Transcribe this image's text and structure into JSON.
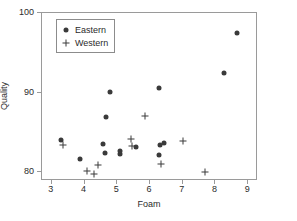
{
  "chart_data": {
    "type": "scatter",
    "title": "",
    "xlabel": "Foam",
    "ylabel": "Quality",
    "xlim": [
      2.7,
      9.3
    ],
    "ylim": [
      78.9,
      100.0
    ],
    "xticks": [
      3,
      4,
      5,
      6,
      7,
      8,
      9
    ],
    "yticks": [
      80,
      90,
      100
    ],
    "xticklabels": [
      "3",
      "4",
      "5",
      "6",
      "7",
      "8",
      "9"
    ],
    "yticklabels": [
      "80",
      "90",
      "100"
    ],
    "grid": false,
    "legend_position": "upper-left-inside",
    "series": [
      {
        "name": "Eastern",
        "marker": "filled-circle",
        "color": "#3a3a3a",
        "points": [
          [
            3.3,
            83.9
          ],
          [
            3.9,
            81.5
          ],
          [
            4.6,
            83.4
          ],
          [
            4.65,
            82.3
          ],
          [
            4.7,
            86.8
          ],
          [
            4.8,
            89.9
          ],
          [
            5.1,
            82.2
          ],
          [
            5.12,
            82.5
          ],
          [
            5.6,
            83.1
          ],
          [
            6.3,
            90.5
          ],
          [
            6.3,
            82.1
          ],
          [
            6.35,
            83.3
          ],
          [
            6.45,
            83.5
          ],
          [
            8.3,
            92.3
          ],
          [
            8.68,
            97.4
          ]
        ]
      },
      {
        "name": "Western",
        "marker": "plus",
        "color": "#3a3a3a",
        "points": [
          [
            3.38,
            83.3
          ],
          [
            4.1,
            80.0
          ],
          [
            4.33,
            79.7
          ],
          [
            4.45,
            80.8
          ],
          [
            5.45,
            84.0
          ],
          [
            5.48,
            83.2
          ],
          [
            5.88,
            86.9
          ],
          [
            6.38,
            80.9
          ],
          [
            7.05,
            83.8
          ],
          [
            7.7,
            79.9
          ]
        ]
      }
    ]
  },
  "legend": {
    "entries": [
      {
        "label": "Eastern",
        "marker": "filled-circle"
      },
      {
        "label": "Western",
        "marker": "plus"
      }
    ]
  },
  "axes": {
    "xlabel": "Foam",
    "ylabel": "Quality"
  }
}
